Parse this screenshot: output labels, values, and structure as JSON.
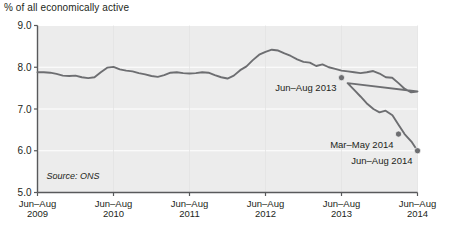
{
  "chart_data": {
    "type": "line",
    "title": "% of all economically active",
    "subtitle": "",
    "xlabel": "",
    "ylabel": "% of all economically active",
    "ylim": [
      5.0,
      9.0
    ],
    "ytick_labels": [
      "9.0",
      "8.0",
      "7.0",
      "6.0",
      "5.0"
    ],
    "ytick_values": [
      9.0,
      8.0,
      7.0,
      6.0,
      5.0
    ],
    "grid": true,
    "grid_color": "#ffffff",
    "plot_background": "#ececec",
    "line_color": "#6d6e71",
    "legend": [],
    "xtick_labels": [
      "Jun–Aug\n2009",
      "Jun–Aug\n2010",
      "Jun–Aug\n2011",
      "Jun–Aug\n2012",
      "Jun–Aug\n2013",
      "Jun–Aug\n2014"
    ],
    "xticks": [
      {
        "line1": "Jun–Aug",
        "line2": "2009"
      },
      {
        "line1": "Jun–Aug",
        "line2": "2010"
      },
      {
        "line1": "Jun–Aug",
        "line2": "2011"
      },
      {
        "line1": "Jun–Aug",
        "line2": "2012"
      },
      {
        "line1": "Jun–Aug",
        "line2": "2013"
      },
      {
        "line1": "Jun–Aug",
        "line2": "2014"
      }
    ],
    "x": [
      0.0,
      0.083,
      0.167,
      0.25,
      0.333,
      0.417,
      0.5,
      0.583,
      0.667,
      0.75,
      0.833,
      0.917,
      1.0,
      1.083,
      1.167,
      1.25,
      1.333,
      1.417,
      1.5,
      1.583,
      1.667,
      1.75,
      1.833,
      1.917,
      2.0,
      2.083,
      2.167,
      2.25,
      2.333,
      2.417,
      2.5,
      2.583,
      2.667,
      2.75,
      2.833,
      2.917,
      3.0,
      3.083,
      3.167,
      3.25,
      3.333,
      3.417,
      3.5,
      3.583,
      3.667,
      3.75,
      3.833,
      3.917,
      4.0,
      4.083,
      4.167,
      4.25,
      4.333,
      4.417,
      4.5,
      4.583,
      4.667,
      4.75,
      4.833,
      4.917,
      5.0
    ],
    "values": [
      7.88,
      7.88,
      7.87,
      7.84,
      7.8,
      7.79,
      7.8,
      7.76,
      7.74,
      7.76,
      7.88,
      7.99,
      8.01,
      7.95,
      7.92,
      7.9,
      7.86,
      7.83,
      7.79,
      7.77,
      7.81,
      7.87,
      7.88,
      7.86,
      7.85,
      7.86,
      7.88,
      7.87,
      7.81,
      7.76,
      7.73,
      7.8,
      7.93,
      8.02,
      8.17,
      8.3,
      8.37,
      8.42,
      8.4,
      8.33,
      8.27,
      8.19,
      8.13,
      8.11,
      8.03,
      8.07,
      8.0,
      7.96,
      7.92,
      7.9,
      7.88,
      7.86,
      7.88,
      7.91,
      7.85,
      7.76,
      7.75,
      7.62,
      7.48,
      7.4,
      7.42
    ],
    "annotations": [
      {
        "label": "Jun–Aug 2013",
        "x": 4.0,
        "y": 7.75,
        "marker": true
      },
      {
        "label": "Mar–May 2014",
        "x": 4.75,
        "y": 6.4,
        "marker": true
      },
      {
        "label": "Jun–Aug 2014",
        "x": 5.0,
        "y": 6.0,
        "marker": true
      }
    ],
    "series_tail": {
      "x": [
        4.0,
        4.08,
        4.17,
        4.25,
        4.33,
        4.42,
        4.5,
        4.58,
        4.67,
        4.75,
        4.83,
        4.92,
        5.0
      ],
      "values": [
        7.75,
        7.62,
        7.45,
        7.3,
        7.14,
        7.0,
        6.92,
        6.96,
        6.85,
        6.62,
        6.4,
        6.22,
        6.0
      ]
    },
    "source": "Source: ONS"
  },
  "page": {
    "title_text": "% of all economically active",
    "source_text": "Source: ONS"
  }
}
